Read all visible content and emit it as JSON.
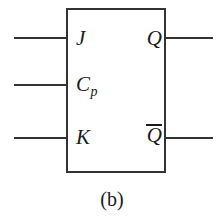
{
  "figure": {
    "caption": "(b)",
    "colors": {
      "line": "#333333",
      "text": "#1a1a1a",
      "background": "#ffffff"
    }
  },
  "symbol": {
    "kind": "jk-flip-flop",
    "inputs": [
      {
        "id": "j",
        "label": "J"
      },
      {
        "id": "cp",
        "label": "C",
        "subscript": "p"
      },
      {
        "id": "k",
        "label": "K"
      }
    ],
    "outputs": [
      {
        "id": "q",
        "label": "Q",
        "complement": false
      },
      {
        "id": "qb",
        "label": "Q",
        "complement": true
      }
    ]
  }
}
